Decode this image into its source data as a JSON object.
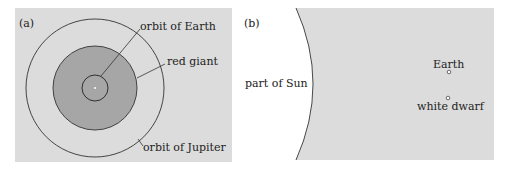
{
  "panel_a": {
    "label": "(a)",
    "background": "#dcdcdc",
    "labels": {
      "orbit_earth": "orbit of Earth",
      "red_giant": "red giant",
      "orbit_jupiter": "orbit of Jupiter"
    },
    "colors": {
      "red_giant_fill": "#a6a6a6",
      "line": "#333333"
    }
  },
  "panel_b": {
    "label": "(b)",
    "background": "#dcdcdc",
    "labels": {
      "sun": "part of Sun",
      "earth": "Earth",
      "white_dwarf": "white dwarf"
    },
    "colors": {
      "sun_fill": "#ffffff"
    }
  }
}
